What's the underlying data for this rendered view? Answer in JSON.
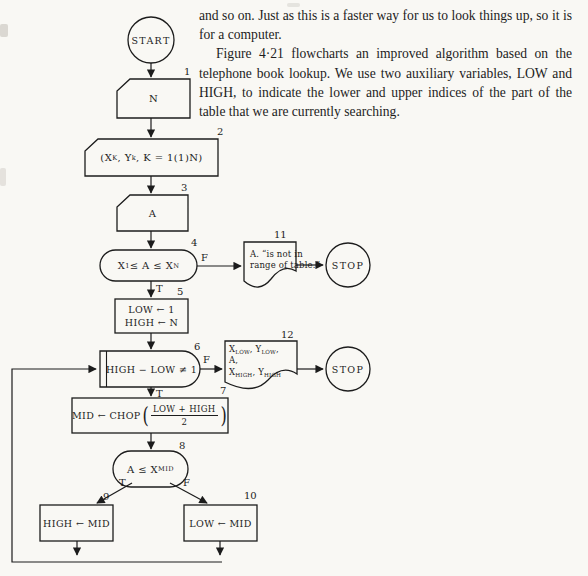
{
  "page": {
    "paragraphs": [
      {
        "text": "and so on. Just as this is a faster way for us to look things up, so it is for a computer."
      },
      {
        "text": "Figure 4·21 flowcharts an improved algorithm based on the telephone book lookup. We use two auxiliary variables, LOW and HIGH, to indicate the lower and upper indices of the part of the table that we are currently searching."
      }
    ]
  },
  "flowchart": {
    "colors": {
      "ink": "#1c1c1c",
      "paper": "#f9f8f4"
    },
    "terminals": {
      "start": "START",
      "stop1": "STOP",
      "stop2": "STOP"
    },
    "branch_labels": {
      "true": "T",
      "false": "F"
    },
    "nodes": {
      "n1": {
        "num": "1",
        "label": [
          {
            "t": "N"
          }
        ]
      },
      "n2": {
        "num": "2",
        "label": [
          {
            "t": "(X"
          },
          {
            "s": "K"
          },
          {
            "t": ", Y"
          },
          {
            "s": "k"
          },
          {
            "t": ", K = 1(1)N)"
          }
        ]
      },
      "n3": {
        "num": "3",
        "label": [
          {
            "t": "A"
          }
        ]
      },
      "n4": {
        "num": "4",
        "label": [
          {
            "t": "X"
          },
          {
            "s": "1"
          },
          {
            "t": " ≤ A ≤ X"
          },
          {
            "s": "N"
          }
        ]
      },
      "n5": {
        "num": "5",
        "lines": [
          [
            {
              "t": "LOW ← 1"
            }
          ],
          [
            {
              "t": "HIGH ← N"
            }
          ]
        ]
      },
      "n6": {
        "num": "6",
        "label": [
          {
            "t": "HIGH − LOW ≠ 1"
          }
        ]
      },
      "n7": {
        "num": "7",
        "prefix": "MID ← CHOP",
        "open_paren": "(",
        "frac_numerator": "LOW + HIGH",
        "frac_denominator": "2",
        "close_paren": ")"
      },
      "n8": {
        "num": "8",
        "label": [
          {
            "t": "A ≤ X"
          },
          {
            "s": "MID"
          }
        ]
      },
      "n9": {
        "num": "9",
        "label": [
          {
            "t": "HIGH ← MID"
          }
        ]
      },
      "n10": {
        "num": "10",
        "label": [
          {
            "t": "LOW ← MID"
          }
        ]
      },
      "n11": {
        "num": "11",
        "lines": [
          [
            {
              "t": "A. “is not in"
            }
          ],
          [
            {
              "t": "range of table.”"
            }
          ]
        ]
      },
      "n12": {
        "num": "12",
        "lines": [
          [
            {
              "t": "X"
            },
            {
              "s": "LOW"
            },
            {
              "t": ", Y"
            },
            {
              "s": "LOW"
            },
            {
              "t": ","
            }
          ],
          [
            {
              "t": "A,"
            }
          ],
          [
            {
              "t": "X"
            },
            {
              "s": "HIGH"
            },
            {
              "t": ", Y"
            },
            {
              "s": "HIGH"
            }
          ]
        ]
      }
    }
  }
}
